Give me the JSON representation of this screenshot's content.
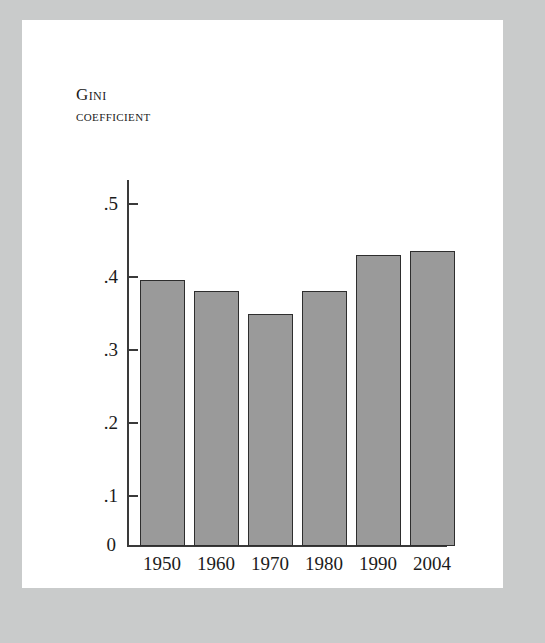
{
  "chart_data": {
    "type": "bar",
    "title": "Gini coefficient",
    "title_lines": [
      "Gini",
      "coefficient"
    ],
    "categories": [
      "1950",
      "1960",
      "1970",
      "1980",
      "1990",
      "2004"
    ],
    "values": [
      0.363,
      0.349,
      0.317,
      0.348,
      0.397,
      0.403
    ],
    "xlabel": "",
    "ylabel": "Gini coefficient",
    "ylim": [
      0,
      0.5
    ],
    "ytick_labels": [
      "0",
      ".1",
      ".2",
      ".3",
      ".4",
      ".5"
    ],
    "ytick_values": [
      0,
      0.1,
      0.2,
      0.3,
      0.4,
      0.5
    ],
    "grid": false,
    "legend": "none",
    "bar_color": "#9a9a9a",
    "bar_edge_color": "#2e2e2e",
    "axis_color": "#3a3a3a",
    "text_color": "#1b1b1b",
    "frame_color": "#c9cbcb",
    "background_color": "#ffffff"
  }
}
